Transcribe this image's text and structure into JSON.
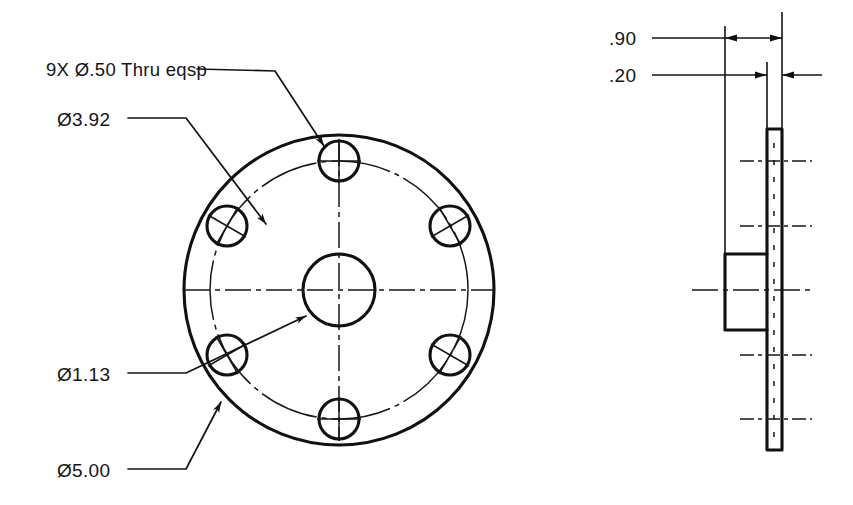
{
  "document": {
    "type": "engineering-drawing",
    "title": "Flange Plate Detail",
    "background_color": "#ffffff",
    "line_color": "#111111",
    "width": 853,
    "height": 505
  },
  "front_view": {
    "name": "front-view",
    "center": {
      "x": 339,
      "y": 290
    },
    "outer_circle": {
      "diameter_label": "Ø5.00",
      "radius_px": 155
    },
    "bolt_circle": {
      "diameter_label": "Ø3.92",
      "radius_px": 129
    },
    "center_hole": {
      "diameter_label": "Ø1.13",
      "radius_px": 36
    },
    "bolt_holes": {
      "count_label": "9X",
      "hole_radius_px": 20,
      "positions": [
        {
          "id": "hole-top",
          "angle_deg": 90,
          "marker": "plus"
        },
        {
          "id": "hole-upper-right",
          "angle_deg": 30,
          "marker": "cross"
        },
        {
          "id": "hole-lower-right",
          "angle_deg": -30,
          "marker": "cross"
        },
        {
          "id": "hole-bottom",
          "angle_deg": -90,
          "marker": "plus"
        },
        {
          "id": "hole-lower-left",
          "angle_deg": -150,
          "marker": "cross"
        },
        {
          "id": "hole-upper-left",
          "angle_deg": 150,
          "marker": "cross"
        }
      ]
    }
  },
  "side_view": {
    "name": "side-section-view",
    "plate": {
      "x": 767,
      "y": 129,
      "width": 15,
      "height": 321
    },
    "boss": {
      "x": 725,
      "y": 254,
      "width": 42,
      "height": 76
    },
    "center_axis_y": 290
  },
  "annotations": {
    "hole_note": {
      "label": "9X Ø.50 Thru eqsp",
      "x": 46,
      "y": 76,
      "leader_points": "197,69 275,71 326,148"
    },
    "bolt_circle_dim": {
      "label": "Ø3.92",
      "x": 57,
      "y": 126,
      "leader_points": "128,118 186,118 265,223"
    },
    "center_hole_dim": {
      "label": "Ø1.13",
      "x": 57,
      "y": 381,
      "leader_points": "128,373 186,373 305,317"
    },
    "outer_dia_dim": {
      "label": "Ø5.00",
      "x": 57,
      "y": 477,
      "leader_points": "128,469 186,469 222,400"
    }
  },
  "dimensions": {
    "thickness_overall": {
      "name": "dimension-90",
      "label": ".90",
      "text_x": 609,
      "text_y": 45,
      "leader_x1": 652,
      "leader_x2": 725,
      "dim_y": 38,
      "ext_left_x": 725,
      "ext_right_x": 782,
      "arrow_direction": "inward"
    },
    "thickness_plate": {
      "name": "dimension-20",
      "label": ".20",
      "text_x": 609,
      "text_y": 82,
      "leader_x1": 652,
      "leader_x2": 767,
      "dim_y": 75,
      "ext_left_x": 767,
      "ext_right_x": 782,
      "arrow_direction": "outward"
    }
  }
}
